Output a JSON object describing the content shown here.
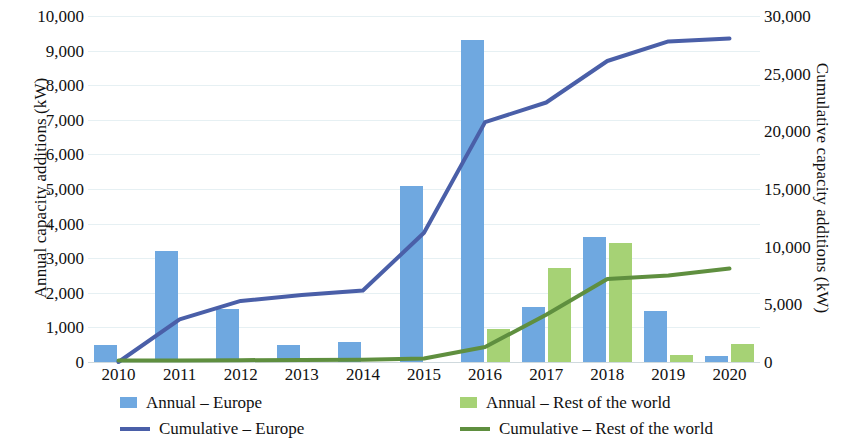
{
  "chart_data": {
    "type": "bar",
    "title": "",
    "subtitle": "",
    "xlabel": "",
    "ylabel": "Annual capacity additions (kW)",
    "y2label": "Cumulative capacity additions (kW)",
    "categories": [
      "2010",
      "2011",
      "2012",
      "2013",
      "2014",
      "2015",
      "2016",
      "2017",
      "2018",
      "2019",
      "2020"
    ],
    "ylim": [
      0,
      10000
    ],
    "y2lim": [
      0,
      30000
    ],
    "y_ticks": [
      "0",
      "1,000",
      "2,000",
      "3,000",
      "4,000",
      "5,000",
      "6,000",
      "7,000",
      "8,000",
      "9,000",
      "10,000"
    ],
    "y2_ticks": [
      "0",
      "5,000",
      "10,000",
      "15,000",
      "20,000",
      "25,000",
      "30,000"
    ],
    "grid": true,
    "legend_position": "bottom",
    "series": [
      {
        "name": "Annual – Europe",
        "kind": "bar",
        "axis": "left",
        "color": "#6fa8e0",
        "values": [
          500,
          3200,
          1530,
          490,
          570,
          5080,
          9300,
          1580,
          3620,
          1470,
          180
        ]
      },
      {
        "name": "Annual – Rest of the world",
        "kind": "bar",
        "axis": "left",
        "color": "#a6d275",
        "values": [
          0,
          0,
          0,
          0,
          0,
          0,
          950,
          2720,
          3440,
          200,
          520
        ]
      },
      {
        "name": "Cumulative – Europe",
        "kind": "line",
        "axis": "right",
        "color": "#4a5fa8",
        "values": [
          0,
          3700,
          5300,
          5800,
          6200,
          11200,
          20800,
          22500,
          26100,
          27800,
          28050
        ]
      },
      {
        "name": "Cumulative – Rest of the world",
        "kind": "line",
        "axis": "right",
        "color": "#5f8f3f",
        "values": [
          120,
          140,
          160,
          180,
          200,
          300,
          1300,
          4100,
          7200,
          7500,
          8100
        ]
      }
    ]
  },
  "legend": {
    "items": [
      {
        "label": "Annual – Europe",
        "marker": "bar-blue"
      },
      {
        "label": "Annual – Rest of the world",
        "marker": "bar-green"
      },
      {
        "label": "Cumulative – Europe",
        "marker": "line-blue"
      },
      {
        "label": "Cumulative – Rest of the world",
        "marker": "line-green"
      }
    ]
  },
  "colors": {
    "bar_europe": "#6fa8e0",
    "bar_rest_of_world": "#a6d275",
    "line_europe": "#4a5fa8",
    "line_rest_of_world": "#5f8f3f",
    "gridline": "#e6f0f3",
    "text": "#111111"
  }
}
